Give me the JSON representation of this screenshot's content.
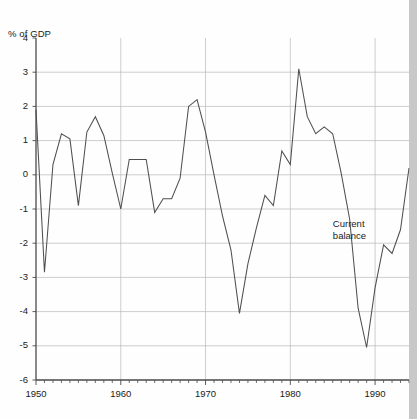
{
  "chart_data": {
    "type": "line",
    "title": "",
    "subtitle": "",
    "xlabel": "",
    "ylabel": "% of GDP",
    "ylim": [
      -6,
      4
    ],
    "xlim": [
      1950,
      1994
    ],
    "grid": true,
    "legend_position": "inline-annotation",
    "y_ticks": [
      4,
      3,
      2,
      1,
      0,
      -1,
      -2,
      -3,
      -4,
      -5,
      -6
    ],
    "y_tick_labels": [
      "4",
      "3",
      "2",
      "1",
      "0",
      "-1",
      "-2",
      "-3",
      "-4",
      "-5",
      "-6"
    ],
    "x_ticks": [
      1950,
      1960,
      1970,
      1980,
      1990
    ],
    "x_tick_labels": [
      "1950",
      "1960",
      "1970",
      "1980",
      "1990"
    ],
    "x_minor_tick_interval": 1,
    "annotations": [
      {
        "text_line1": "Current",
        "text_line2": "balance",
        "x": 1989.5,
        "y": -1.6
      }
    ],
    "series": [
      {
        "name": "Current balance",
        "color": "#4f4f4f",
        "x": [
          1950,
          1951,
          1952,
          1953,
          1954,
          1955,
          1956,
          1957,
          1958,
          1959,
          1960,
          1961,
          1962,
          1963,
          1964,
          1965,
          1966,
          1967,
          1968,
          1969,
          1970,
          1971,
          1972,
          1973,
          1974,
          1975,
          1976,
          1977,
          1978,
          1979,
          1980,
          1981,
          1982,
          1983,
          1984,
          1985,
          1986,
          1987,
          1988,
          1989,
          1990,
          1991,
          1992,
          1993,
          1994
        ],
        "values": [
          1.9,
          -2.85,
          0.3,
          1.2,
          1.05,
          -0.9,
          1.25,
          1.7,
          1.15,
          0.05,
          -1.0,
          0.45,
          0.45,
          0.45,
          -1.1,
          -0.7,
          -0.7,
          -0.1,
          2.0,
          2.2,
          1.25,
          0.0,
          -1.2,
          -2.2,
          -4.05,
          -2.6,
          -1.55,
          -0.6,
          -0.9,
          0.7,
          0.3,
          3.1,
          1.7,
          1.2,
          1.4,
          1.2,
          0.05,
          -1.3,
          -3.9,
          -5.05,
          -3.3,
          -2.05,
          -2.3,
          -1.6,
          0.2
        ]
      }
    ]
  }
}
